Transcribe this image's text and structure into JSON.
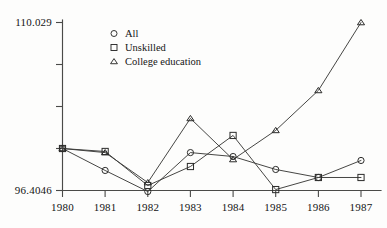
{
  "chart_data": {
    "type": "line",
    "title": "",
    "subtitle": "",
    "xlabel": "",
    "ylabel": "",
    "categories": [
      "1980",
      "1981",
      "1982",
      "1983",
      "1984",
      "1985",
      "1986",
      "1987"
    ],
    "x": [
      1980,
      1981,
      1982,
      1983,
      1984,
      1985,
      1986,
      1987
    ],
    "series": [
      {
        "name": "All",
        "marker": "circle",
        "values": [
          99.81,
          98.03,
          96.32,
          99.48,
          99.16,
          98.11,
          97.46,
          98.84
        ]
      },
      {
        "name": "Unskilled",
        "marker": "square",
        "values": [
          99.81,
          99.57,
          96.81,
          98.35,
          100.87,
          96.48,
          97.46,
          97.46
        ]
      },
      {
        "name": "College education",
        "marker": "triangle",
        "values": [
          99.81,
          99.48,
          97.05,
          102.25,
          98.92,
          101.28,
          104.52,
          110.03
        ]
      }
    ],
    "ylim": [
      96.4046,
      110.029
    ],
    "xlim": [
      1980,
      1987
    ],
    "y_tick_labels": [
      "96.4046",
      "110.029"
    ],
    "y_tick_values": [
      96.4046,
      110.029
    ],
    "y_tick_count": 5,
    "x_tick_labels": [
      "1980",
      "1981",
      "1982",
      "1983",
      "1984",
      "1985",
      "1986",
      "1987"
    ],
    "grid": false,
    "legend_position": "top-center",
    "legend_entries": [
      {
        "label": "All",
        "marker": "circle"
      },
      {
        "label": "Unskilled",
        "marker": "square"
      },
      {
        "label": "College education",
        "marker": "triangle"
      }
    ],
    "colors": {
      "line": "#3c3c3a",
      "axis": "#4a4a48",
      "text": "#141414",
      "background": "#fdfdfc"
    }
  }
}
